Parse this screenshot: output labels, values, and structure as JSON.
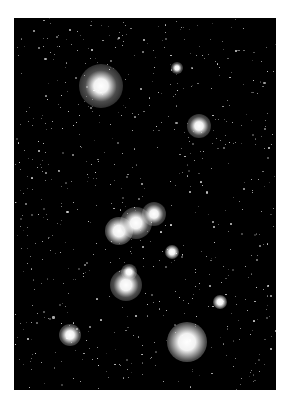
{
  "image": {
    "subject": "Orion constellation star field",
    "frame": {
      "left": 14,
      "top": 18,
      "width": 262,
      "height": 372,
      "background": "#000000"
    },
    "page_background": "#ffffff"
  },
  "bright_stars": [
    {
      "name": "betelgeuse",
      "x": 101,
      "y": 86,
      "core": 5,
      "glow": 22
    },
    {
      "name": "bellatrix",
      "x": 199,
      "y": 126,
      "core": 3,
      "glow": 12
    },
    {
      "name": "meissa",
      "x": 177,
      "y": 68,
      "core": 1.5,
      "glow": 6
    },
    {
      "name": "alnitak",
      "x": 119,
      "y": 231,
      "core": 4,
      "glow": 14
    },
    {
      "name": "alnilam",
      "x": 136,
      "y": 223,
      "core": 4,
      "glow": 16
    },
    {
      "name": "mintaka",
      "x": 154,
      "y": 214,
      "core": 3,
      "glow": 12
    },
    {
      "name": "orion-nebula",
      "x": 126,
      "y": 285,
      "core": 4,
      "glow": 16
    },
    {
      "name": "iota-orionis",
      "x": 129,
      "y": 272,
      "core": 2,
      "glow": 8
    },
    {
      "name": "rigel",
      "x": 187,
      "y": 342,
      "core": 6,
      "glow": 20
    },
    {
      "name": "saiph",
      "x": 70,
      "y": 335,
      "core": 3,
      "glow": 11
    },
    {
      "name": "eta-orionis",
      "x": 172,
      "y": 252,
      "core": 2,
      "glow": 7
    },
    {
      "name": "tau-orionis",
      "x": 220,
      "y": 302,
      "core": 2,
      "glow": 7
    }
  ],
  "field": {
    "seed": 42,
    "count": 700,
    "max_size": 1.6
  }
}
